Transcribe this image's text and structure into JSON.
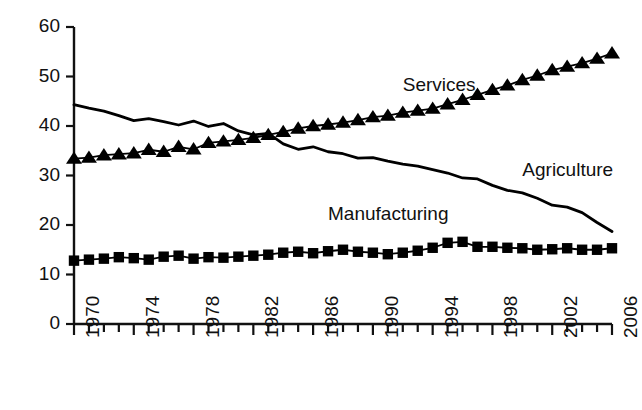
{
  "chart_data": {
    "type": "line",
    "title": "",
    "subtitle": "",
    "xlabel": "",
    "ylabel": "",
    "xlim": [
      1970,
      2006
    ],
    "ylim": [
      0,
      60
    ],
    "yticks": [
      0,
      10,
      20,
      30,
      40,
      50,
      60
    ],
    "ytick_labels": [
      "0",
      "10",
      "20",
      "30",
      "40",
      "50",
      "60"
    ],
    "xticks": [
      1970,
      1971,
      1972,
      1973,
      1974,
      1975,
      1976,
      1977,
      1978,
      1979,
      1980,
      1981,
      1982,
      1983,
      1984,
      1985,
      1986,
      1987,
      1988,
      1989,
      1990,
      1991,
      1992,
      1993,
      1994,
      1995,
      1996,
      1997,
      1998,
      1999,
      2000,
      2001,
      2002,
      2003,
      2004,
      2005,
      2006
    ],
    "xtick_labels": [
      "1970",
      "1974",
      "1978",
      "1982",
      "1986",
      "1990",
      "1994",
      "1998",
      "2002",
      "2006"
    ],
    "xtick_labeled_years": [
      1970,
      1974,
      1978,
      1982,
      1986,
      1990,
      1994,
      1998,
      2002,
      2006
    ],
    "grid": false,
    "legend_position": "inline-annotations",
    "x": [
      1970,
      1971,
      1972,
      1973,
      1974,
      1975,
      1976,
      1977,
      1978,
      1979,
      1980,
      1981,
      1982,
      1983,
      1984,
      1985,
      1986,
      1987,
      1988,
      1989,
      1990,
      1991,
      1992,
      1993,
      1994,
      1995,
      1996,
      1997,
      1998,
      1999,
      2000,
      2001,
      2002,
      2003,
      2004,
      2005,
      2006
    ],
    "series": [
      {
        "name": "Agriculture",
        "marker": "none",
        "color": "#000000",
        "label_x": 2000,
        "label_y": 31,
        "values": [
          44.3,
          43.6,
          43.0,
          42.1,
          41.1,
          41.5,
          40.9,
          40.2,
          41.0,
          39.9,
          40.5,
          39.0,
          38.2,
          38.5,
          36.4,
          35.3,
          35.8,
          34.8,
          34.4,
          33.5,
          33.6,
          32.9,
          32.3,
          31.9,
          31.2,
          30.5,
          29.5,
          29.3,
          28.0,
          27.0,
          26.5,
          25.4,
          24.0,
          23.6,
          22.5,
          20.5,
          18.7
        ]
      },
      {
        "name": "Services",
        "marker": "triangle",
        "color": "#000000",
        "label_x": 1992,
        "label_y": 48,
        "values": [
          33.4,
          33.6,
          34.1,
          34.3,
          34.5,
          35.2,
          34.8,
          35.8,
          35.3,
          36.6,
          36.9,
          37.2,
          37.6,
          38.2,
          38.8,
          39.5,
          40.0,
          40.3,
          40.7,
          41.2,
          41.8,
          42.1,
          42.7,
          43.1,
          43.5,
          44.4,
          45.3,
          46.3,
          47.3,
          48.2,
          49.3,
          50.2,
          51.3,
          52.0,
          52.7,
          53.6,
          54.7
        ]
      },
      {
        "name": "Manufacturing",
        "marker": "square",
        "color": "#000000",
        "label_x": 1987,
        "label_y": 22,
        "values": [
          12.8,
          13.0,
          13.2,
          13.5,
          13.3,
          13.0,
          13.6,
          13.8,
          13.2,
          13.5,
          13.4,
          13.6,
          13.8,
          14.0,
          14.4,
          14.6,
          14.3,
          14.7,
          15.0,
          14.6,
          14.4,
          14.1,
          14.4,
          14.8,
          15.4,
          16.4,
          16.6,
          15.6,
          15.6,
          15.4,
          15.3,
          15.0,
          15.1,
          15.3,
          15.0,
          15.0,
          15.3
        ]
      }
    ]
  },
  "axes": {
    "y_axis_name": "y-axis",
    "x_axis_name": "x-axis"
  }
}
